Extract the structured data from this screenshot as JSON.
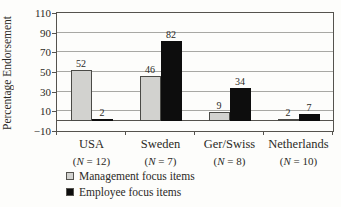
{
  "chart_data": {
    "type": "bar",
    "title": "",
    "ylabel": "Percentage Endorsement",
    "xlabel": "",
    "ylim": [
      -10,
      110
    ],
    "yticks": [
      110,
      90,
      70,
      50,
      30,
      10,
      -10
    ],
    "grid": true,
    "value_labels": true,
    "legend_position": "bottom-left",
    "categories": [
      "USA",
      "Sweden",
      "Ger/Swiss",
      "Netherlands"
    ],
    "category_sublabels": [
      "(N = 12)",
      "(N = 7)",
      "(N = 8)",
      "(N = 10)"
    ],
    "series": [
      {
        "name": "Management focus items",
        "color": "#d2d2cf",
        "border": "#4a4a46",
        "values": [
          52,
          46,
          9,
          2
        ]
      },
      {
        "name": "Employee focus items",
        "color": "#0d0d0d",
        "border": "#0d0d0d",
        "values": [
          2,
          82,
          34,
          7
        ]
      }
    ]
  },
  "style": {
    "background": "#fdfdfb",
    "text_color": "#2b2a26",
    "gridline_color": "#a8a8a4",
    "axis_color": "#55534e"
  }
}
